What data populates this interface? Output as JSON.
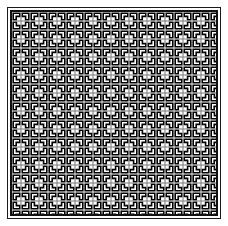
{
  "page": {
    "title": "Geometric Tiling Pattern",
    "width": 228,
    "height": 226,
    "background_color": "#ffffff"
  },
  "frame": {
    "name": "outer-frame",
    "inset_px": 7,
    "width": 214,
    "height": 212,
    "stroke_color": "#1a1a1a",
    "stroke_width": 1,
    "fill_color": "#ffffff"
  },
  "inner_outline": {
    "name": "inner-outline",
    "inset_px": 10,
    "width": 208,
    "height": 206,
    "stroke_color": "#111111",
    "stroke_width": 2,
    "fill_color": "#ffffff"
  },
  "pattern": {
    "name": "meander-basketweave",
    "description": "Dense repeating interlocking L-shaped meander (Greek key / basketweave) motif",
    "tile_period_px": 9,
    "columns": 23,
    "rows": 23,
    "ink_color": "#000000",
    "paper_color": "#ffffff",
    "midtone_color": "#808080",
    "stroke_width": 1.6,
    "orientation": "alternating-quarter-turn"
  },
  "chart_data": {
    "type": "heatmap",
    "title": "Geometric Tiling Pattern",
    "xlabel": "",
    "ylabel": "",
    "categories": [
      "tile-column"
    ],
    "values": [
      9
    ],
    "grid": true,
    "legend": "none"
  }
}
